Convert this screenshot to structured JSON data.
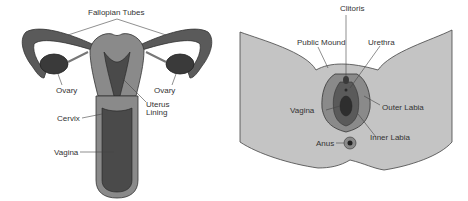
{
  "left_diagram": {
    "labels": {
      "fallopian_tubes": "Fallopian Tubes",
      "ovary_left": "Ovary",
      "ovary_right": "Ovary",
      "uterus_lining_1": "Uterus",
      "uterus_lining_2": "Lining",
      "cervix": "Cervix",
      "vagina": "Vagina"
    }
  },
  "right_diagram": {
    "labels": {
      "clitoris": "Clitoris",
      "pubic_mound": "Public Mound",
      "urethra": "Urethra",
      "vagina": "Vagina",
      "outer_labia": "Outer Labia",
      "inner_labia": "Inner Labia",
      "anus": "Anus"
    }
  },
  "colors": {
    "outer": "#5a5a5a",
    "mid": "#8a8a8a",
    "light": "#b8b8b8",
    "dark": "#3a3a3a",
    "skin": "#c4c4c4"
  }
}
